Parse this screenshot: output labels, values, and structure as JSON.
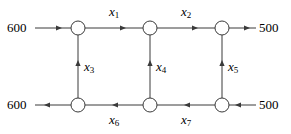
{
  "diagram": {
    "type": "network-flow-diagram",
    "title": "",
    "colors": {
      "line": "#3a3a3a",
      "node_fill": "#ffffff",
      "node_stroke": "#3a3a3a",
      "text": "#000000"
    },
    "nodes": [
      {
        "id": "n1",
        "name": "node-top-left",
        "x": 78,
        "y": 28
      },
      {
        "id": "n2",
        "name": "node-top-middle",
        "x": 150,
        "y": 28
      },
      {
        "id": "n3",
        "name": "node-top-right",
        "x": 222,
        "y": 28
      },
      {
        "id": "n4",
        "name": "node-bottom-left",
        "x": 78,
        "y": 105
      },
      {
        "id": "n5",
        "name": "node-bottom-middle",
        "x": 150,
        "y": 105
      },
      {
        "id": "n6",
        "name": "node-bottom-right",
        "x": 222,
        "y": 105
      }
    ],
    "node_radius": 7,
    "supplies": [
      {
        "name": "supply-top-left",
        "value": "600",
        "x": 16,
        "y": 28,
        "side": "left"
      },
      {
        "name": "supply-top-right",
        "value": "500",
        "x": 268,
        "y": 28,
        "side": "right"
      },
      {
        "name": "supply-bottom-left",
        "value": "600",
        "x": 16,
        "y": 105,
        "side": "left"
      },
      {
        "name": "supply-bottom-right",
        "value": "500",
        "x": 268,
        "y": 105,
        "side": "right"
      }
    ],
    "edges": [
      {
        "name": "edge-inflow-top-left",
        "label": "",
        "from": "external-left-top",
        "to": "n1",
        "direction": "right"
      },
      {
        "name": "edge-x1",
        "label": "x1",
        "from": "n1",
        "to": "n2",
        "direction": "right"
      },
      {
        "name": "edge-x2",
        "label": "x2",
        "from": "n2",
        "to": "n3",
        "direction": "right"
      },
      {
        "name": "edge-outflow-top-right",
        "label": "",
        "from": "n3",
        "to": "external-right-top",
        "direction": "right"
      },
      {
        "name": "edge-x3",
        "label": "x3",
        "from": "n4",
        "to": "n1",
        "direction": "up"
      },
      {
        "name": "edge-x4",
        "label": "x4",
        "from": "n5",
        "to": "n2",
        "direction": "up"
      },
      {
        "name": "edge-x5",
        "label": "x5",
        "from": "n6",
        "to": "n3",
        "direction": "up"
      },
      {
        "name": "edge-outflow-bottom-left",
        "label": "",
        "from": "n4",
        "to": "external-left-bottom",
        "direction": "left"
      },
      {
        "name": "edge-x6",
        "label": "x6",
        "from": "n5",
        "to": "n4",
        "direction": "left"
      },
      {
        "name": "edge-x7",
        "label": "x7",
        "from": "n6",
        "to": "n5",
        "direction": "left"
      },
      {
        "name": "edge-inflow-bottom-right",
        "label": "",
        "from": "external-right-bottom",
        "to": "n6",
        "direction": "left"
      }
    ],
    "variable_labels": [
      {
        "name": "label-x1",
        "base": "x",
        "sub": "1",
        "x": 114,
        "y": 12
      },
      {
        "name": "label-x2",
        "base": "x",
        "sub": "2",
        "x": 186,
        "y": 12
      },
      {
        "name": "label-x3",
        "base": "x",
        "sub": "3",
        "x": 86,
        "y": 66
      },
      {
        "name": "label-x4",
        "base": "x",
        "sub": "4",
        "x": 158,
        "y": 66
      },
      {
        "name": "label-x5",
        "base": "x",
        "sub": "5",
        "x": 230,
        "y": 66
      },
      {
        "name": "label-x6",
        "base": "x",
        "sub": "6",
        "x": 114,
        "y": 120
      },
      {
        "name": "label-x7",
        "base": "x",
        "sub": "7",
        "x": 186,
        "y": 120
      }
    ]
  }
}
